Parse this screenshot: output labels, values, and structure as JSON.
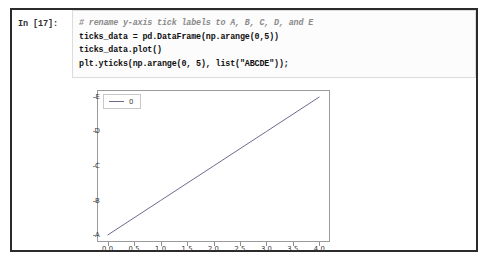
{
  "notebook": {
    "prompt": "In [17]:",
    "code_lines": [
      {
        "text": "# rename y-axis tick labels to A, B, C, D, and E",
        "style": "comment"
      },
      {
        "text": "ticks_data = pd.DataFrame(np.arange(0,5))",
        "style": "code"
      },
      {
        "text": "ticks_data.plot()",
        "style": "code"
      },
      {
        "text": "plt.yticks(np.arange(0, 5), list(\"ABCDE\"));",
        "style": "code"
      }
    ]
  },
  "chart_data": {
    "type": "line",
    "title": "",
    "xlabel": "",
    "ylabel": "",
    "x": [
      0,
      1,
      2,
      3,
      4
    ],
    "series": [
      {
        "name": "0",
        "values": [
          0,
          1,
          2,
          3,
          4
        ]
      }
    ],
    "xlim": [
      -0.2,
      4.2
    ],
    "ylim": [
      -0.2,
      4.2
    ],
    "xticks": [
      0.0,
      0.5,
      1.0,
      1.5,
      2.0,
      2.5,
      3.0,
      3.5,
      4.0
    ],
    "xticklabels": [
      "0.0",
      "0.5",
      "1.0",
      "1.5",
      "2.0",
      "2.5",
      "3.0",
      "3.5",
      "4.0"
    ],
    "yticks": [
      0,
      1,
      2,
      3,
      4
    ],
    "yticklabels": [
      "A",
      "B",
      "C",
      "D",
      "E"
    ],
    "grid": false,
    "legend": {
      "position": "upper left",
      "entries": [
        "0"
      ]
    },
    "line_color": "#6b6b8f"
  }
}
